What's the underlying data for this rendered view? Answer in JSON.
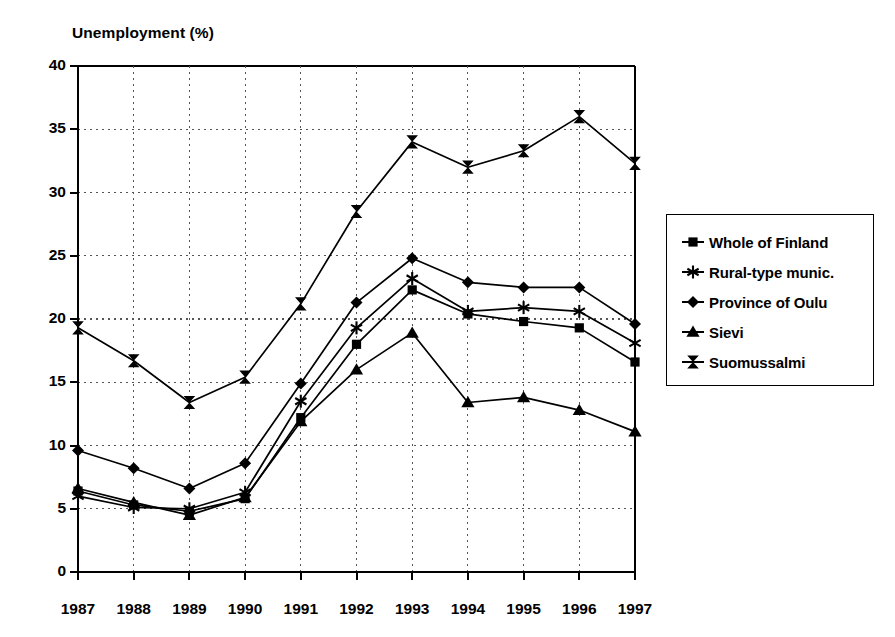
{
  "chart_data": {
    "type": "line",
    "title": "",
    "ylabel": "Unemployment (%)",
    "xlabel": "",
    "categories": [
      "1987",
      "1988",
      "1989",
      "1990",
      "1991",
      "1992",
      "1993",
      "1994",
      "1995",
      "1996",
      "1997"
    ],
    "x": [
      1987,
      1988,
      1989,
      1990,
      1991,
      1992,
      1993,
      1994,
      1995,
      1996,
      1997
    ],
    "ylim": [
      0,
      40
    ],
    "yticks": [
      0,
      5,
      10,
      15,
      20,
      25,
      30,
      35,
      40
    ],
    "grid": true,
    "grid_style": "dotted",
    "legend_position": "right-outside",
    "series": [
      {
        "name": "Whole of Finland",
        "marker": "square",
        "values": [
          6.4,
          5.3,
          4.8,
          5.8,
          12.2,
          18.0,
          22.3,
          20.4,
          19.8,
          19.3,
          16.6
        ]
      },
      {
        "name": "Rural-type munic.",
        "marker": "asterisk",
        "values": [
          6.0,
          5.1,
          5.0,
          6.3,
          13.5,
          19.3,
          23.2,
          20.6,
          20.9,
          20.6,
          18.1
        ]
      },
      {
        "name": "Province of Oulu",
        "marker": "diamond",
        "values": [
          9.6,
          8.2,
          6.6,
          8.6,
          14.9,
          21.3,
          24.8,
          22.9,
          22.5,
          22.5,
          19.6
        ]
      },
      {
        "name": "Sievi",
        "marker": "triangle",
        "values": [
          6.6,
          5.5,
          4.5,
          5.9,
          11.9,
          16.0,
          18.9,
          13.4,
          13.8,
          12.8,
          11.1
        ]
      },
      {
        "name": "Suomussalmi",
        "marker": "bowtie",
        "values": [
          19.3,
          16.7,
          13.4,
          15.4,
          21.2,
          28.5,
          34.0,
          32.0,
          33.3,
          36.0,
          32.3
        ]
      }
    ]
  },
  "axis": {
    "y_title": "Unemployment (%)",
    "y_tick_labels": [
      "40",
      "35",
      "30",
      "25",
      "20",
      "15",
      "10",
      "5",
      "0"
    ],
    "x_tick_labels": [
      "1987",
      "1988",
      "1989",
      "1990",
      "1991",
      "1992",
      "1993",
      "1994",
      "1995",
      "1996",
      "1997"
    ]
  },
  "legend": {
    "items": [
      {
        "label": "Whole of Finland",
        "marker": "square-marker-icon"
      },
      {
        "label": "Rural-type munic.",
        "marker": "asterisk-marker-icon"
      },
      {
        "label": "Province of Oulu",
        "marker": "diamond-marker-icon"
      },
      {
        "label": "Sievi",
        "marker": "triangle-marker-icon"
      },
      {
        "label": "Suomussalmi",
        "marker": "bowtie-marker-icon"
      }
    ]
  },
  "colors": {
    "ink": "#000000",
    "background": "#ffffff",
    "grid": "#555555"
  }
}
